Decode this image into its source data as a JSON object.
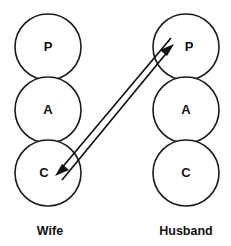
{
  "diagram": {
    "type": "transactional-analysis-crossed-transaction",
    "columns": [
      {
        "id": "wife",
        "label": "Wife",
        "label_x": 50,
        "label_y": 235,
        "center_x": 48,
        "states": [
          {
            "id": "wife-parent",
            "letter": "P",
            "cx": 48,
            "cy": 47,
            "r": 33
          },
          {
            "id": "wife-adult",
            "letter": "A",
            "cx": 48,
            "cy": 110,
            "r": 33
          },
          {
            "id": "wife-child",
            "letter": "C",
            "cx": 48,
            "cy": 173,
            "r": 33
          }
        ]
      },
      {
        "id": "husband",
        "label": "Husband",
        "label_x": 186,
        "label_y": 235,
        "center_x": 186,
        "states": [
          {
            "id": "husband-parent",
            "letter": "P",
            "cx": 186,
            "cy": 47,
            "r": 33
          },
          {
            "id": "husband-adult",
            "letter": "A",
            "cx": 186,
            "cy": 110,
            "r": 33
          },
          {
            "id": "husband-child",
            "letter": "C",
            "cx": 186,
            "cy": 173,
            "r": 33
          }
        ]
      }
    ],
    "transactions": [
      {
        "id": "stimulus-child-to-parent",
        "from": "wife-child",
        "to": "husband-parent",
        "direction": "up-right",
        "x1": 62,
        "y1": 180,
        "x2": 174,
        "y2": 44,
        "arrow_at": "end"
      },
      {
        "id": "response-parent-to-child",
        "from": "husband-parent",
        "to": "wife-child",
        "direction": "down-left",
        "x1": 171,
        "y1": 38,
        "x2": 55,
        "y2": 176,
        "arrow_at": "end"
      }
    ],
    "colors": {
      "stroke": "#1a1a1a",
      "text": "#111111",
      "background": "#ffffff"
    }
  }
}
